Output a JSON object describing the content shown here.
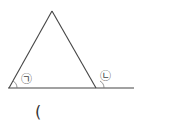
{
  "diagram": {
    "type": "triangle-exterior-angle",
    "colors": {
      "line": "#444444",
      "background": "#ffffff"
    },
    "points": {
      "apex": [
        52,
        11
      ],
      "left_base": [
        9,
        88
      ],
      "right_base": [
        96,
        88
      ],
      "line_end": [
        134,
        88
      ]
    },
    "labels": {
      "angle_a": "㉠",
      "angle_b": "㉡"
    },
    "answer_paren": "("
  }
}
